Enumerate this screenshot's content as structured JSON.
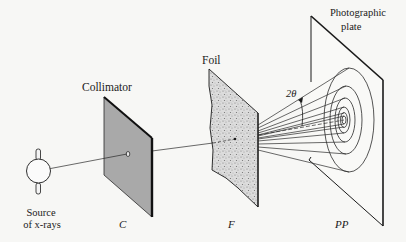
{
  "diagram": {
    "type": "x-ray diffraction experimental setup (Debye-Scherrer powder method)",
    "labels": {
      "collimator": "Collimator",
      "foil": "Foil",
      "plate_line1": "Photographic",
      "plate_line2": "plate",
      "source_line1": "Source",
      "source_line2": "of x-rays",
      "angle": "2θ",
      "c": "C",
      "f": "F",
      "pp": "PP"
    },
    "components": [
      {
        "id": "source",
        "name": "Source of x-rays",
        "symbol": ""
      },
      {
        "id": "collimator",
        "name": "Collimator",
        "symbol": "C"
      },
      {
        "id": "foil",
        "name": "Foil",
        "symbol": "F"
      },
      {
        "id": "plate",
        "name": "Photographic plate",
        "symbol": "PP"
      }
    ],
    "colors": {
      "ink": "#1a1a1a",
      "collimator_fill": "#a9a9a9",
      "foil_fill": "#d4d4d4",
      "background": "#f7f7f5"
    }
  }
}
